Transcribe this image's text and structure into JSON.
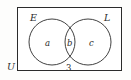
{
  "figure": {
    "kind": "venn-diagram",
    "universe_label": "U",
    "sets": [
      {
        "id": "E",
        "label": "E",
        "position": "left"
      },
      {
        "id": "L",
        "label": "L",
        "position": "right"
      }
    ],
    "regions": [
      {
        "id": "a",
        "label": "a",
        "meaning": "E only"
      },
      {
        "id": "b",
        "label": "b",
        "meaning": "E and L"
      },
      {
        "id": "c",
        "label": "c",
        "meaning": "L only"
      }
    ],
    "outside_count": "3",
    "colors": {
      "stroke": "#2b2b2b",
      "background": "#fdfdfc",
      "interior": "#ffffff",
      "text": "#2b2b2b"
    }
  }
}
